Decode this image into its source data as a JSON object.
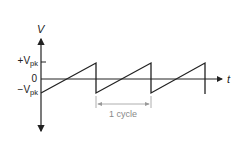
{
  "diagram": {
    "type": "sawtooth-waveform",
    "axes": {
      "y_label": "V",
      "x_label": "t",
      "ticks": {
        "positive_peak": {
          "prefix": "+V",
          "sub": "pk"
        },
        "zero": "0",
        "negative_peak": {
          "prefix": "−V",
          "sub": "pk"
        }
      }
    },
    "annotation": {
      "label": "1 cycle"
    },
    "colors": {
      "line": "#222222",
      "annotation": "#888888"
    }
  }
}
